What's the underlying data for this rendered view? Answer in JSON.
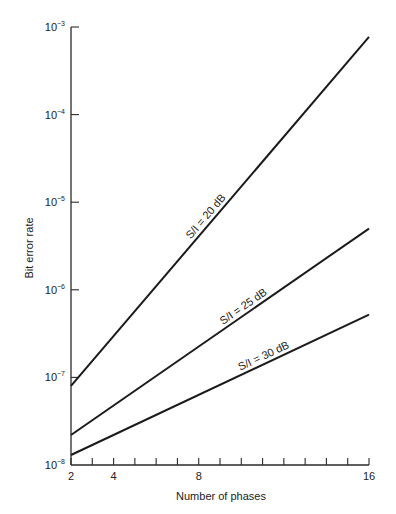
{
  "chart_data": {
    "type": "line",
    "title": "",
    "xlabel": "Number of phases",
    "ylabel": "Bit error rate",
    "xscale": "linear",
    "yscale": "log",
    "xlim": [
      2,
      16
    ],
    "ylim": [
      1e-08,
      0.001
    ],
    "x_ticks": [
      2,
      3,
      4,
      5,
      6,
      7,
      8,
      9,
      10,
      11,
      12,
      13,
      14,
      15,
      16
    ],
    "x_tick_labels": [
      {
        "value": 2,
        "label": "2"
      },
      {
        "value": 4,
        "label": "4"
      },
      {
        "value": 8,
        "label": "8"
      },
      {
        "value": 16,
        "label": "16"
      }
    ],
    "y_tick_labels": [
      {
        "value": 0.001,
        "base": "10",
        "exp": "−3"
      },
      {
        "value": 0.0001,
        "base": "10",
        "exp": "−4"
      },
      {
        "value": 1e-05,
        "base": "10",
        "exp": "−5"
      },
      {
        "value": 1e-06,
        "base": "10",
        "exp": "−6"
      },
      {
        "value": 1e-07,
        "base": "10",
        "exp": "−7"
      },
      {
        "value": 1e-08,
        "base": "10",
        "exp": "−8"
      }
    ],
    "grid": false,
    "legend": "inline labels on lines",
    "x": [
      2,
      8,
      16
    ],
    "series": [
      {
        "name": "S/I = 20 dB",
        "x": [
          2,
          16
        ],
        "values": [
          8e-08,
          0.00077
        ],
        "label_at_x": 8.6
      },
      {
        "name": "S/I = 25 dB",
        "x": [
          2,
          16
        ],
        "values": [
          2.2e-08,
          5e-06
        ],
        "label_at_x": 10.3
      },
      {
        "name": "S/I = 30 dB",
        "x": [
          2,
          16
        ],
        "values": [
          1.3e-08,
          5.2e-07
        ],
        "label_at_x": 11.2
      }
    ]
  },
  "labels": {
    "xlabel": "Number of phases",
    "ylabel": "Bit error rate",
    "series": [
      "S/I = 20 dB",
      "S/I = 25 dB",
      "S/I = 30 dB"
    ]
  }
}
